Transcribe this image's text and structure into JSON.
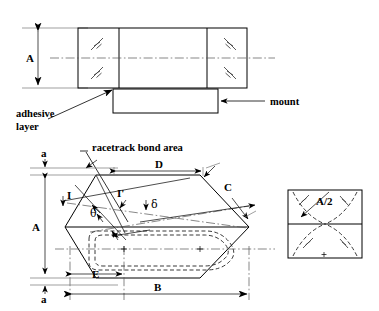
{
  "figure": {
    "colors": {
      "ink": "#000000",
      "centerline": "#555555",
      "extension": "#777777",
      "background": "#ffffff"
    },
    "top_view": {
      "dimension_A": "A",
      "callout_adhesive_line1": "adhesive",
      "callout_adhesive_line2": "layer",
      "callout_mount": "mount"
    },
    "plan_view": {
      "callout_racetrack": "racetrack bond area",
      "dimension_a_top": "a",
      "dimension_a_bottom": "a",
      "dimension_A": "A",
      "dimension_B": "B",
      "dimension_C": "C",
      "dimension_D": "D",
      "dimension_E": "E",
      "label_I": "I",
      "label_I_prime": "I'",
      "angle_theta": "θ",
      "angle_delta": "δ"
    },
    "detail_view": {
      "dimension_A_half": "A/2"
    }
  }
}
